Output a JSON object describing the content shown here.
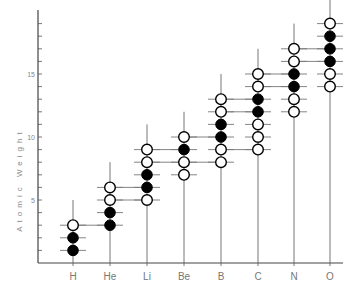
{
  "chart_data": {
    "type": "scatter",
    "title": "",
    "xlabel": "",
    "ylabel": "Atomic Weight",
    "ylim": [
      0,
      20
    ],
    "yticks": [
      5,
      10,
      15
    ],
    "grid": false,
    "legend": {
      "filled": "filled circle",
      "open": "open circle"
    },
    "categories": [
      "H",
      "He",
      "Li",
      "Be",
      "B",
      "C",
      "N",
      "O"
    ],
    "series": [
      {
        "element": "H",
        "filled": [
          1,
          2
        ],
        "open": [
          3
        ]
      },
      {
        "element": "He",
        "filled": [
          3,
          4
        ],
        "open": [
          5,
          6
        ]
      },
      {
        "element": "Li",
        "filled": [
          6,
          7
        ],
        "open": [
          5,
          8,
          9
        ]
      },
      {
        "element": "Be",
        "filled": [
          9
        ],
        "open": [
          7,
          8,
          10
        ]
      },
      {
        "element": "B",
        "filled": [
          10,
          11
        ],
        "open": [
          8,
          9,
          12,
          13
        ]
      },
      {
        "element": "C",
        "filled": [
          12,
          13
        ],
        "open": [
          9,
          10,
          11,
          14,
          15
        ]
      },
      {
        "element": "N",
        "filled": [
          14,
          15
        ],
        "open": [
          12,
          13,
          16,
          17
        ]
      },
      {
        "element": "O",
        "filled": [
          16,
          17,
          18
        ],
        "open": [
          14,
          15,
          19
        ]
      }
    ]
  }
}
